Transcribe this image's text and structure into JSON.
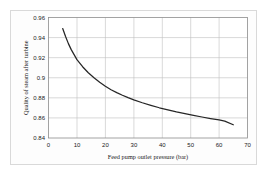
{
  "figure": {
    "background_color": "#ffffff",
    "frame_color": "#d9d9d9",
    "plot_border_color": "#808080",
    "grid_color": "#bfbfbf",
    "series_color": "#262626"
  },
  "chart_data": {
    "type": "line",
    "title": "",
    "xlabel": "Feed pump outlet pressure (bar)",
    "ylabel": "Quality of steam after turbine",
    "xlim": [
      0,
      70
    ],
    "ylim": [
      0.84,
      0.96
    ],
    "xticks": [
      0,
      10,
      20,
      30,
      40,
      50,
      60,
      70
    ],
    "xtick_labels": [
      "0",
      "10",
      "20",
      "30",
      "40",
      "50",
      "60",
      "70"
    ],
    "yticks": [
      0.84,
      0.86,
      0.88,
      0.9,
      0.92,
      0.94,
      0.96
    ],
    "ytick_labels": [
      "0.84",
      "0.86",
      "0.88",
      "0.9",
      "0.92",
      "0.94",
      "0.96"
    ],
    "grid": true,
    "grid_axis": "both",
    "legend": false,
    "legend_position": "none",
    "series": [
      {
        "name": "Quality of steam after turbine",
        "x": [
          5,
          6,
          7,
          8,
          9,
          10,
          12,
          14,
          16,
          18,
          20,
          22,
          24,
          26,
          28,
          30,
          33,
          36,
          39,
          42,
          45,
          48,
          51,
          54,
          57,
          60,
          62,
          65
        ],
        "y": [
          0.949,
          0.941,
          0.934,
          0.928,
          0.923,
          0.918,
          0.911,
          0.905,
          0.9,
          0.8955,
          0.8915,
          0.888,
          0.8852,
          0.8826,
          0.8802,
          0.878,
          0.8751,
          0.8725,
          0.8701,
          0.868,
          0.866,
          0.8642,
          0.8625,
          0.8609,
          0.8594,
          0.858,
          0.8568,
          0.8532
        ]
      }
    ]
  }
}
